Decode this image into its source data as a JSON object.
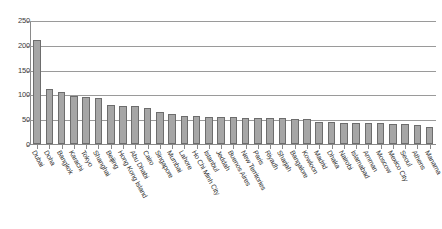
{
  "chart_data": {
    "type": "bar",
    "title": "",
    "subtitle": "",
    "xlabel": "",
    "ylabel": "",
    "ylim": [
      0,
      250
    ],
    "yticks": [
      0,
      50,
      100,
      150,
      200,
      250
    ],
    "grid": true,
    "legend": false,
    "legend_position": "none",
    "bar_color": "#a6a6a6",
    "bar_border_color": "#6d6d6d",
    "axis_color": "#8a8a8a",
    "gridline_color": "#9a9a9a",
    "label_color": "#2f2f2f",
    "label_rotation_deg": 61,
    "categories": [
      "Dubai",
      "Doha",
      "Bangkok",
      "Karachi",
      "Tokyo",
      "Shanghai",
      "Beijing",
      "Hong Kong Island",
      "Abu Dhabi",
      "Cairo",
      "Singapore",
      "Mumbai",
      "Lahore",
      "Ho Chi Minh City",
      "Istanbul",
      "Jeddah",
      "Buenos Aires",
      "New Territories",
      "Paris",
      "Riyadh",
      "Sharjah",
      "Bangalore",
      "Kowloon",
      "Madrid",
      "Dhaka",
      "Nairobi",
      "Islamabad",
      "Amman",
      "Moscow",
      "Mexico City",
      "Seoul",
      "Athens",
      "Manama"
    ],
    "values": [
      210,
      110,
      104,
      96,
      95,
      93,
      78,
      77,
      76,
      72,
      64,
      61,
      57,
      56,
      55,
      54,
      54,
      53,
      53,
      52,
      52,
      51,
      50,
      45,
      44,
      43,
      43,
      42,
      42,
      41,
      40,
      39,
      35
    ]
  }
}
